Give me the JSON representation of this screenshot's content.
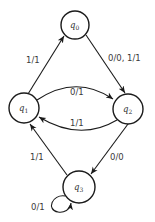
{
  "diagram": {
    "type": "finite-state-machine (Mealy)",
    "colors": {
      "stroke": "#1a1a1a",
      "text": "#333333",
      "background": "#ffffff"
    },
    "states": [
      {
        "id": "q0",
        "base": "q",
        "sub": "0",
        "cx": 75,
        "cy": 25,
        "r": 14
      },
      {
        "id": "q1",
        "base": "q",
        "sub": "1",
        "cx": 24,
        "cy": 108,
        "r": 15
      },
      {
        "id": "q2",
        "base": "q",
        "sub": "2",
        "cx": 128,
        "cy": 109,
        "r": 15
      },
      {
        "id": "q3",
        "base": "q",
        "sub": "3",
        "cx": 79,
        "cy": 187,
        "r": 16
      }
    ],
    "transitions": [
      {
        "from": "q1",
        "to": "q0",
        "label": "1/1"
      },
      {
        "from": "q0",
        "to": "q2",
        "label": "0/0, 1/1"
      },
      {
        "from": "q1",
        "to": "q2",
        "label": "0/1"
      },
      {
        "from": "q2",
        "to": "q1",
        "label": "1/1"
      },
      {
        "from": "q2",
        "to": "q3",
        "label": "0/0"
      },
      {
        "from": "q3",
        "to": "q1",
        "label": "1/1"
      },
      {
        "from": "q3",
        "to": "q3",
        "label": "0/1"
      }
    ]
  }
}
